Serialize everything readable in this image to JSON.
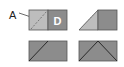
{
  "labels": {
    "a": "A",
    "d": "D"
  },
  "colors": {
    "light_fill": "#b9b9b9",
    "dark_fill": "#8a8a8a",
    "stroke": "#3a3a3a",
    "label_text": "#222222",
    "d_text": "#ffffff"
  },
  "panels": [
    {
      "id": "top-left",
      "description": "light square with dashed diagonal (A) beside dark square (D)"
    },
    {
      "id": "top-right",
      "description": "light triangle attached to dark square"
    },
    {
      "id": "bottom-left",
      "description": "dark rectangle split by diagonal line"
    },
    {
      "id": "bottom-right",
      "description": "dark rectangle with peaked triangle lines"
    }
  ]
}
